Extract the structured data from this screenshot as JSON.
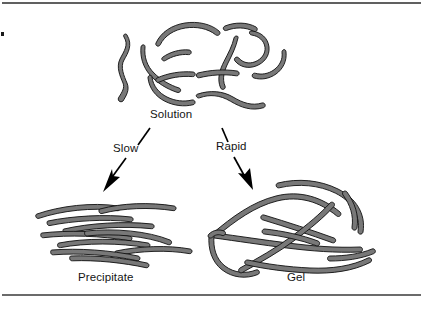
{
  "figure": {
    "title_alt": "Polymer chain organization: solution to precipitate or gel",
    "background_color": "#ffffff",
    "chain_fill_color": "#787878",
    "chain_outline_color": "#101010",
    "rule_color": "#2b2b2b",
    "arrow_color": "#000000",
    "text_color": "#141414"
  },
  "labels": {
    "solution": "Solution",
    "precipitate": "Precipitate",
    "gel": "Gel",
    "slow": "Slow",
    "rapid": "Rapid"
  },
  "states": [
    {
      "id": "solution",
      "label": "Solution",
      "description": "Dispersed random-coil polymer chains"
    },
    {
      "id": "precipitate",
      "label": "Precipitate",
      "description": "Chains aligned and stacked into ordered bundles"
    },
    {
      "id": "gel",
      "label": "Gel",
      "description": "Chains joined into a continuous crosslinked network"
    }
  ],
  "transitions": [
    {
      "id": "slow",
      "label": "Slow",
      "from": "solution",
      "to": "precipitate"
    },
    {
      "id": "rapid",
      "label": "Rapid",
      "from": "solution",
      "to": "gel"
    }
  ]
}
